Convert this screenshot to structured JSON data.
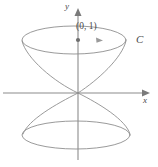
{
  "figure": {
    "background_color": "#ffffff",
    "stroke_color": "#8f8f8f",
    "axis_color": "#8c8c8c",
    "label_color": "#4a4a4a",
    "labels": {
      "y_axis": "y",
      "x_axis": "x",
      "point": "(0, 1)",
      "curve": "C"
    },
    "axes": {
      "x_axis": {
        "name": "x-axis",
        "start": [
          3,
          93
        ],
        "end": [
          150,
          93
        ],
        "arrow": "right"
      },
      "y_axis": {
        "name": "y-axis",
        "start": [
          78,
          160
        ],
        "end": [
          78,
          8
        ],
        "arrow": "up"
      },
      "origin": [
        78,
        93
      ]
    },
    "marked_point": {
      "label": "(0, 1)",
      "pixel": [
        78,
        40
      ],
      "coordinates": [
        0,
        1
      ]
    },
    "direction_arrow": {
      "name": "orientation-arrow",
      "pixel": [
        101,
        40
      ],
      "direction": "right"
    },
    "upper_lobe": {
      "name": "upper-cone-lobe",
      "rim_center": [
        74,
        40
      ],
      "rim_rx": 52,
      "rim_ry": 14,
      "apex": [
        78,
        93
      ]
    },
    "lower_lobe": {
      "name": "lower-cone-lobe",
      "rim_center": [
        76,
        135
      ],
      "rim_rx": 54,
      "rim_ry": 14,
      "apex": [
        78,
        93
      ]
    }
  }
}
